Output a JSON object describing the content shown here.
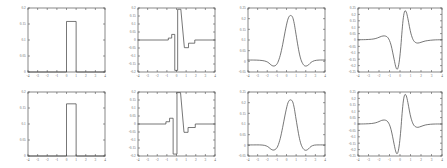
{
  "figure": {
    "rows": 2,
    "cols": 4,
    "background": "#ffffff",
    "line_color": "#4a4a4a",
    "axis_color": "#555555",
    "tick_label_color": "#666666"
  },
  "chart_data": [
    {
      "id": "panel-r1c1",
      "type": "line",
      "title": "",
      "xlabel": "",
      "ylabel": "",
      "xlim": [
        -4,
        4
      ],
      "ylim": [
        0,
        0.2
      ],
      "grid": false,
      "legend": null,
      "xticks": [
        -4,
        -3,
        -2,
        -1,
        0,
        1,
        2,
        3,
        4
      ],
      "xticklabels": [
        "-4",
        "-3",
        "-2",
        "-1",
        "0",
        "1",
        "2",
        "3",
        "4"
      ],
      "yticks": [
        0,
        0.05,
        0.1,
        0.15,
        0.2
      ],
      "yticklabels": [
        "0",
        "0.05",
        "0.1",
        "0.15",
        "0.2"
      ],
      "series": [
        {
          "name": "box-pulse",
          "x": [
            -4,
            -0.02,
            0,
            0,
            1,
            1,
            1.02,
            4
          ],
          "y": [
            0,
            0,
            0,
            0.158,
            0.158,
            0,
            0,
            0
          ]
        }
      ]
    },
    {
      "id": "panel-r1c2",
      "type": "line",
      "title": "",
      "xlabel": "",
      "ylabel": "",
      "xlim": [
        -4,
        4
      ],
      "ylim": [
        -0.2,
        0.2
      ],
      "grid": false,
      "legend": null,
      "xticks": [
        -4,
        -3,
        -2,
        -1,
        0,
        1,
        2,
        3,
        4
      ],
      "xticklabels": [
        "-4",
        "-3",
        "-2",
        "-1",
        "0",
        "1",
        "2",
        "3",
        "4"
      ],
      "yticks": [
        -0.2,
        -0.15,
        -0.1,
        -0.05,
        0,
        0.05,
        0.1,
        0.15,
        0.2
      ],
      "yticklabels": [
        "-0.2",
        "-0.15",
        "-0.1",
        "-0.05",
        "0",
        "0.05",
        "0.1",
        "0.15",
        "0.2"
      ],
      "series": [
        {
          "name": "haar-derivative",
          "x": [
            -4,
            -0.85,
            -0.85,
            -0.5,
            -0.5,
            -0.18,
            -0.18,
            -0.18,
            0.12,
            0.12,
            0.12,
            0.45,
            0.45,
            0.82,
            0.82,
            1.25,
            1.25,
            1.9,
            1.9,
            4
          ],
          "y": [
            0,
            0,
            0.012,
            0.012,
            0.035,
            0.035,
            0.035,
            -0.19,
            -0.19,
            -0.19,
            0.192,
            0.192,
            0.192,
            -0.048,
            -0.048,
            -0.048,
            -0.02,
            -0.02,
            0,
            0
          ]
        }
      ]
    },
    {
      "id": "panel-r1c3",
      "type": "line",
      "title": "",
      "xlabel": "",
      "ylabel": "",
      "xlim": [
        -4,
        4
      ],
      "ylim": [
        -0.05,
        0.25
      ],
      "grid": false,
      "legend": null,
      "xticks": [
        -4,
        -3,
        -2,
        -1,
        0,
        1,
        2,
        3,
        4
      ],
      "xticklabels": [
        "-4",
        "-3",
        "-2",
        "-1",
        "0",
        "1",
        "2",
        "3",
        "4"
      ],
      "yticks": [
        -0.05,
        0,
        0.05,
        0.1,
        0.15,
        0.2,
        0.25
      ],
      "yticklabels": [
        "-0.05",
        "0",
        "0.05",
        "0.1",
        "0.15",
        "0.2",
        "0.25"
      ],
      "series": [
        {
          "name": "smooth-bump",
          "x": [
            -4,
            -3.4,
            -2.8,
            -2.3,
            -1.95,
            -1.7,
            -1.5,
            -1.3,
            -1.1,
            -0.9,
            -0.65,
            -0.4,
            -0.15,
            0.1,
            0.3,
            0.5,
            0.65,
            0.8,
            0.95,
            1.15,
            1.35,
            1.55,
            1.8,
            2.05,
            2.3,
            2.55,
            2.9,
            3.4,
            4
          ],
          "y": [
            0.006,
            0.006,
            0.005,
            0.002,
            -0.004,
            -0.013,
            -0.02,
            -0.022,
            -0.018,
            -0.005,
            0.028,
            0.078,
            0.138,
            0.19,
            0.212,
            0.214,
            0.205,
            0.178,
            0.138,
            0.082,
            0.034,
            0.002,
            -0.018,
            -0.022,
            -0.016,
            -0.005,
            0.003,
            0.006,
            0.006
          ]
        }
      ]
    },
    {
      "id": "panel-r1c4",
      "type": "line",
      "title": "",
      "xlabel": "",
      "ylabel": "",
      "xlim": [
        -4,
        4
      ],
      "ylim": [
        -0.25,
        0.25
      ],
      "grid": false,
      "legend": null,
      "xticks": [
        -4,
        -3,
        -2,
        -1,
        0,
        1,
        2,
        3,
        4
      ],
      "xticklabels": [
        "-4",
        "-3",
        "-2",
        "-1",
        "0",
        "1",
        "2",
        "3",
        "4"
      ],
      "yticks": [
        -0.25,
        -0.2,
        -0.15,
        -0.1,
        -0.05,
        0,
        0.05,
        0.1,
        0.15,
        0.2,
        0.25
      ],
      "yticklabels": [
        "-0.25",
        "-0.2",
        "-0.15",
        "-0.1",
        "-0.05",
        "0",
        "0.05",
        "0.1",
        "0.15",
        "0.2",
        "0.25"
      ],
      "series": [
        {
          "name": "smooth-wavelet",
          "x": [
            -4,
            -3.3,
            -2.7,
            -2.3,
            -2.0,
            -1.75,
            -1.5,
            -1.3,
            -1.15,
            -1.0,
            -0.85,
            -0.7,
            -0.55,
            -0.42,
            -0.3,
            -0.18,
            -0.05,
            0.08,
            0.2,
            0.32,
            0.45,
            0.6,
            0.75,
            0.9,
            1.05,
            1.25,
            1.45,
            1.7,
            2.0,
            2.4,
            2.9,
            3.4,
            4
          ],
          "y": [
            0.002,
            0.003,
            0.006,
            0.012,
            0.021,
            0.029,
            0.032,
            0.028,
            0.018,
            -0.004,
            -0.04,
            -0.095,
            -0.155,
            -0.204,
            -0.228,
            -0.215,
            -0.155,
            -0.05,
            0.075,
            0.175,
            0.225,
            0.218,
            0.168,
            0.104,
            0.048,
            0.002,
            -0.018,
            -0.024,
            -0.018,
            -0.008,
            -0.002,
            0.001,
            0.002
          ]
        }
      ]
    },
    {
      "id": "panel-r2c1",
      "type": "line",
      "title": "",
      "xlabel": "",
      "ylabel": "",
      "xlim": [
        -4,
        4
      ],
      "ylim": [
        0,
        0.2
      ],
      "grid": false,
      "legend": null,
      "xticks": [
        -4,
        -3,
        -2,
        -1,
        0,
        1,
        2,
        3,
        4
      ],
      "xticklabels": [
        "-4",
        "-3",
        "-2",
        "-1",
        "0",
        "1",
        "2",
        "3",
        "4"
      ],
      "yticks": [
        0,
        0.05,
        0.1,
        0.15,
        0.2
      ],
      "yticklabels": [
        "0",
        "0.05",
        "0.1",
        "0.15",
        "0.2"
      ],
      "series": [
        {
          "name": "box-pulse",
          "x": [
            -4,
            -0.02,
            0,
            0,
            1,
            1,
            1.02,
            4
          ],
          "y": [
            0,
            0,
            0,
            0.163,
            0.163,
            0,
            0,
            0
          ]
        }
      ]
    },
    {
      "id": "panel-r2c2",
      "type": "line",
      "title": "",
      "xlabel": "",
      "ylabel": "",
      "xlim": [
        -4,
        4
      ],
      "ylim": [
        -0.2,
        0.2
      ],
      "grid": false,
      "legend": null,
      "xticks": [
        -4,
        -3,
        -2,
        -1,
        0,
        1,
        2,
        3,
        4
      ],
      "xticklabels": [
        "-4",
        "-3",
        "-2",
        "-1",
        "0",
        "1",
        "2",
        "3",
        "4"
      ],
      "yticks": [
        -0.2,
        -0.15,
        -0.1,
        -0.05,
        0,
        0.05,
        0.1,
        0.15,
        0.2
      ],
      "yticklabels": [
        "-0.2",
        "-0.15",
        "-0.1",
        "-0.05",
        "0",
        "0.05",
        "0.1",
        "0.15",
        "0.2"
      ],
      "series": [
        {
          "name": "haar-derivative-mirrored",
          "x": [
            -4,
            -1.1,
            -1.1,
            -0.72,
            -0.72,
            -0.35,
            -0.35,
            -0.35,
            0.05,
            0.05,
            0.05,
            0.42,
            0.42,
            0.78,
            0.78,
            1.2,
            1.2,
            1.95,
            1.95,
            4
          ],
          "y": [
            0,
            0,
            0.014,
            0.014,
            0.036,
            0.036,
            0.036,
            -0.188,
            -0.188,
            -0.188,
            0.196,
            0.196,
            0.196,
            -0.052,
            -0.052,
            -0.052,
            -0.022,
            -0.022,
            0,
            0
          ]
        }
      ]
    },
    {
      "id": "panel-r2c3",
      "type": "line",
      "title": "",
      "xlabel": "",
      "ylabel": "",
      "xlim": [
        -4,
        4
      ],
      "ylim": [
        -0.05,
        0.25
      ],
      "grid": false,
      "legend": null,
      "xticks": [
        -4,
        -3,
        -2,
        -1,
        0,
        1,
        2,
        3,
        4
      ],
      "xticklabels": [
        "-4",
        "-3",
        "-2",
        "-1",
        "0",
        "1",
        "2",
        "3",
        "4"
      ],
      "yticks": [
        -0.05,
        0,
        0.05,
        0.1,
        0.15,
        0.2,
        0.25
      ],
      "yticklabels": [
        "-0.05",
        "0",
        "0.05",
        "0.1",
        "0.15",
        "0.2",
        "0.25"
      ],
      "series": [
        {
          "name": "smooth-bump",
          "x": [
            -4,
            -3.4,
            -2.8,
            -2.3,
            -1.95,
            -1.7,
            -1.5,
            -1.3,
            -1.1,
            -0.9,
            -0.65,
            -0.4,
            -0.15,
            0.1,
            0.3,
            0.5,
            0.65,
            0.8,
            0.95,
            1.15,
            1.35,
            1.55,
            1.8,
            2.05,
            2.3,
            2.55,
            2.9,
            3.4,
            4
          ],
          "y": [
            0.002,
            0.002,
            0.002,
            0.0,
            -0.006,
            -0.015,
            -0.021,
            -0.022,
            -0.017,
            -0.003,
            0.032,
            0.084,
            0.142,
            0.192,
            0.211,
            0.212,
            0.203,
            0.176,
            0.135,
            0.08,
            0.032,
            0.0,
            -0.019,
            -0.023,
            -0.016,
            -0.005,
            0.001,
            0.002,
            0.002
          ]
        }
      ]
    },
    {
      "id": "panel-r2c4",
      "type": "line",
      "title": "",
      "xlabel": "",
      "ylabel": "",
      "xlim": [
        -4,
        4
      ],
      "ylim": [
        -0.25,
        0.25
      ],
      "grid": false,
      "legend": null,
      "xticks": [
        -4,
        -3,
        -2,
        -1,
        0,
        1,
        2,
        3,
        4
      ],
      "xticklabels": [
        "-4",
        "-3",
        "-2",
        "-1",
        "0",
        "1",
        "2",
        "3",
        "4"
      ],
      "yticks": [
        -0.25,
        -0.2,
        -0.15,
        -0.1,
        -0.05,
        0,
        0.05,
        0.1,
        0.15,
        0.2,
        0.25
      ],
      "yticklabels": [
        "-0.25",
        "-0.2",
        "-0.15",
        "-0.1",
        "-0.05",
        "0",
        "0.05",
        "0.1",
        "0.15",
        "0.2",
        "0.25"
      ],
      "series": [
        {
          "name": "smooth-wavelet",
          "x": [
            -4,
            -3.3,
            -2.7,
            -2.3,
            -2.0,
            -1.75,
            -1.5,
            -1.3,
            -1.15,
            -1.0,
            -0.85,
            -0.7,
            -0.55,
            -0.42,
            -0.3,
            -0.18,
            -0.05,
            0.08,
            0.2,
            0.32,
            0.45,
            0.6,
            0.75,
            0.9,
            1.05,
            1.25,
            1.45,
            1.7,
            2.0,
            2.4,
            2.9,
            3.4,
            4
          ],
          "y": [
            0.0,
            0.001,
            0.004,
            0.01,
            0.019,
            0.028,
            0.031,
            0.027,
            0.016,
            -0.006,
            -0.044,
            -0.1,
            -0.162,
            -0.21,
            -0.232,
            -0.216,
            -0.152,
            -0.045,
            0.082,
            0.18,
            0.228,
            0.22,
            0.168,
            0.102,
            0.046,
            0.0,
            -0.02,
            -0.026,
            -0.019,
            -0.008,
            -0.002,
            0.0,
            0.0
          ]
        }
      ]
    }
  ]
}
